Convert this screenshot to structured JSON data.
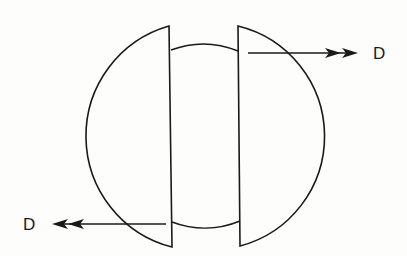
{
  "diagram": {
    "colors": {
      "stroke": "#1a1a1a",
      "background": "#fdfdfc"
    },
    "labels": {
      "right_force": "D",
      "left_force": "D"
    },
    "shapes": {
      "inner_circle": {
        "cx": 203,
        "cy": 136,
        "r": 92
      },
      "left_piece": {
        "flat_top": [
          169,
          26
        ],
        "flat_bottom": [
          172,
          247
        ],
        "arc_r": 114.5
      },
      "right_piece": {
        "flat_top": [
          238,
          26
        ],
        "flat_bottom": [
          240,
          246
        ],
        "arc_r": 113.5
      },
      "right_arrow": {
        "x1": 248,
        "y": 53,
        "x2": 357,
        "direction": "right",
        "heads": 2
      },
      "left_arrow": {
        "x1": 166,
        "y": 224,
        "x2": 52,
        "direction": "left",
        "heads": 2
      }
    }
  }
}
